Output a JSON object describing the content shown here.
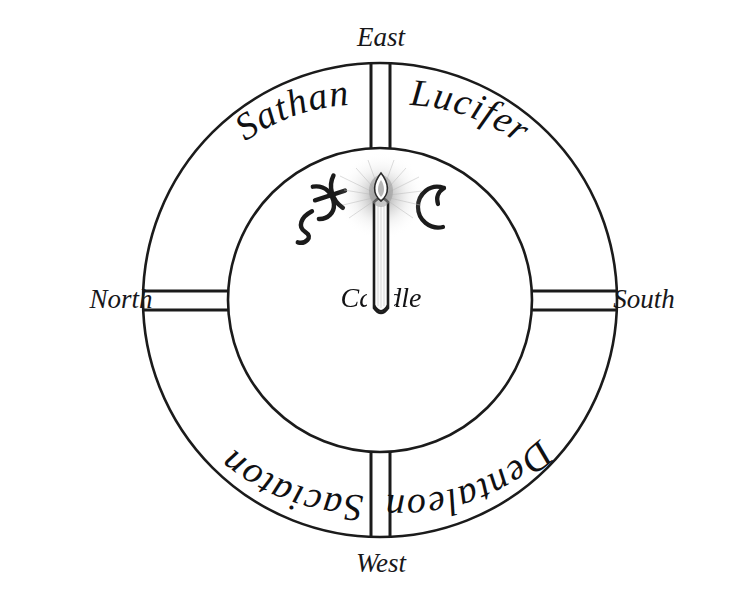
{
  "diagram": {
    "background_color": "#ffffff",
    "ink_color": "#1b1b1b",
    "center": {
      "x": 380,
      "y": 300
    },
    "outer_radius": 237,
    "inner_radius": 152
  },
  "cardinal_labels": [
    {
      "id": "east",
      "text": "East",
      "position": "top",
      "x": 381,
      "y": 46
    },
    {
      "id": "north",
      "text": "North",
      "position": "left",
      "x": 86,
      "y": 308
    },
    {
      "id": "south",
      "text": "South",
      "position": "right",
      "x": 679,
      "y": 308
    },
    {
      "id": "west",
      "text": "West",
      "position": "bottom",
      "x": 381,
      "y": 572
    }
  ],
  "ring_labels": [
    {
      "id": "sathan",
      "text": "Sathan",
      "quadrant": "upper-left",
      "orientation": "upright"
    },
    {
      "id": "lucifer",
      "text": "Lucifer",
      "quadrant": "upper-right",
      "orientation": "upright"
    },
    {
      "id": "saciaton",
      "text": "Saciaton",
      "quadrant": "lower-left",
      "orientation": "inverted"
    },
    {
      "id": "dentaleon",
      "text": "Dentaleon",
      "quadrant": "lower-right",
      "orientation": "inverted"
    }
  ],
  "ring_dividers": [
    {
      "id": "divider-east",
      "angle_deg": 270
    },
    {
      "id": "divider-south",
      "angle_deg": 0
    },
    {
      "id": "divider-west",
      "angle_deg": 90
    },
    {
      "id": "divider-north",
      "angle_deg": 180
    }
  ],
  "center_elements": {
    "candle_label": "Candle",
    "candle_label_x": 381,
    "candle_label_y": 307,
    "sigils": [
      {
        "id": "pisces-sigil",
        "name": "pisces-sigil",
        "description": "Pisces-like glyph",
        "x": 320,
        "y": 202
      },
      {
        "id": "crescent-sigil",
        "name": "crescent-moon-sigil",
        "description": "Crescent moon glyph",
        "x": 432,
        "y": 203
      }
    ]
  }
}
